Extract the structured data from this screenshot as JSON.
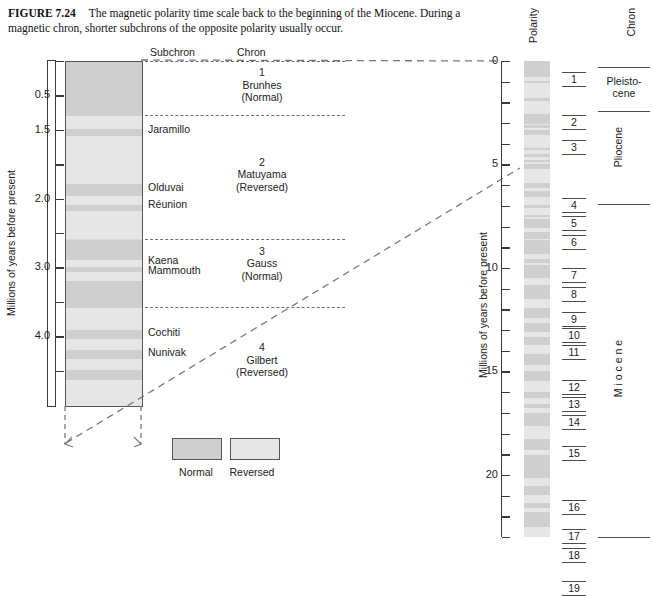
{
  "caption": {
    "figure_number": "FIGURE 7.24",
    "text": "The magnetic polarity time scale back to the beginning of the Miocene. During a magnetic chron, shorter subchrons of the opposite polarity usually occur."
  },
  "colors": {
    "normal": "#cfcfcf",
    "reversed": "#e6e6e6",
    "axis": "#3a3a3a",
    "dashed": "#6f6f6f",
    "text": "#222222"
  },
  "left_panel": {
    "axis_label": "Millions of years before present",
    "headers": {
      "subchron": "Subchron",
      "chron": "Chron"
    },
    "axis": {
      "min": 0,
      "max": 5.0,
      "tick_labels": [
        "0.5",
        "1.5",
        "2.0",
        "3.0",
        "4.0"
      ]
    },
    "ticks": [
      {
        "label": "",
        "value": 0.0
      },
      {
        "label": "0.5",
        "value": 0.5
      },
      {
        "label": "1.5",
        "value": 1.0
      },
      {
        "label": "",
        "value": 1.5
      },
      {
        "label": "2.0",
        "value": 2.0
      },
      {
        "label": "",
        "value": 2.5
      },
      {
        "label": "3.0",
        "value": 3.0
      },
      {
        "label": "",
        "value": 3.5
      },
      {
        "label": "4.0",
        "value": 4.0
      },
      {
        "label": "",
        "value": 4.5
      }
    ],
    "subchrons": [
      {
        "name": "Jaramillo",
        "value": 1.0
      },
      {
        "name": "Olduvai",
        "value": 1.85
      },
      {
        "name": "Réunion",
        "value": 2.1
      },
      {
        "name": "Kaena",
        "value": 2.9
      },
      {
        "name": "Mammouth",
        "value": 3.05
      },
      {
        "name": "Cochiti",
        "value": 3.95
      },
      {
        "name": "Nunivak",
        "value": 4.25
      }
    ],
    "chrons": [
      {
        "number": "1",
        "name": "Brunhes",
        "polarity": "(Normal)",
        "value": 0.35
      },
      {
        "number": "2",
        "name": "Matuyama",
        "polarity": "(Reversed)",
        "value": 1.65
      },
      {
        "number": "3",
        "name": "Gauss",
        "polarity": "(Normal)",
        "value": 2.95
      },
      {
        "number": "4",
        "name": "Gilbert",
        "polarity": "(Reversed)",
        "value": 4.35
      }
    ],
    "chron_boundaries": [
      0.0,
      0.78,
      2.58,
      3.58
    ],
    "bands": [
      {
        "polarity": "normal",
        "top": 0.0,
        "bottom": 0.78
      },
      {
        "polarity": "reversed",
        "top": 0.78,
        "bottom": 0.97
      },
      {
        "polarity": "normal",
        "top": 0.97,
        "bottom": 1.07
      },
      {
        "polarity": "reversed",
        "top": 1.07,
        "bottom": 1.78
      },
      {
        "polarity": "normal",
        "top": 1.78,
        "bottom": 1.95
      },
      {
        "polarity": "reversed",
        "top": 1.95,
        "bottom": 2.08
      },
      {
        "polarity": "normal",
        "top": 2.08,
        "bottom": 2.16
      },
      {
        "polarity": "reversed",
        "top": 2.16,
        "bottom": 2.58
      },
      {
        "polarity": "normal",
        "top": 2.58,
        "bottom": 2.88
      },
      {
        "polarity": "reversed",
        "top": 2.88,
        "bottom": 2.98
      },
      {
        "polarity": "normal",
        "top": 2.98,
        "bottom": 3.05
      },
      {
        "polarity": "reversed",
        "top": 3.05,
        "bottom": 3.18
      },
      {
        "polarity": "normal",
        "top": 3.18,
        "bottom": 3.58
      },
      {
        "polarity": "reversed",
        "top": 3.58,
        "bottom": 3.9
      },
      {
        "polarity": "normal",
        "top": 3.9,
        "bottom": 4.03
      },
      {
        "polarity": "reversed",
        "top": 4.03,
        "bottom": 4.18
      },
      {
        "polarity": "normal",
        "top": 4.18,
        "bottom": 4.32
      },
      {
        "polarity": "reversed",
        "top": 4.32,
        "bottom": 4.48
      },
      {
        "polarity": "normal",
        "top": 4.48,
        "bottom": 4.62
      },
      {
        "polarity": "reversed",
        "top": 4.62,
        "bottom": 5.0
      }
    ]
  },
  "legend": {
    "items": [
      {
        "label": "Normal",
        "polarity": "normal"
      },
      {
        "label": "Reversed",
        "polarity": "reversed"
      }
    ]
  },
  "right_panel": {
    "axis_label": "Millions of years before present",
    "polarity_header": "Polarity",
    "chron_header": "Chron",
    "axis": {
      "min": 0,
      "max": 23,
      "major_tick_labels": [
        "0",
        "5",
        "10",
        "15",
        "20"
      ],
      "major_step": 5,
      "minor_step": 1
    },
    "chron_numbers": [
      {
        "number": "1",
        "value": 0.9
      },
      {
        "number": "2",
        "value": 3.0
      },
      {
        "number": "3",
        "value": 4.2
      },
      {
        "number": "4",
        "value": 7.0
      },
      {
        "number": "5",
        "value": 7.9
      },
      {
        "number": "6",
        "value": 8.8
      },
      {
        "number": "7",
        "value": 10.4
      },
      {
        "number": "8",
        "value": 11.3
      },
      {
        "number": "9",
        "value": 12.5
      },
      {
        "number": "10",
        "value": 13.3
      },
      {
        "number": "11",
        "value": 14.1
      },
      {
        "number": "12",
        "value": 15.8
      },
      {
        "number": "13",
        "value": 16.6
      },
      {
        "number": "14",
        "value": 17.5
      },
      {
        "number": "15",
        "value": 19.0
      },
      {
        "number": "16",
        "value": 21.6
      },
      {
        "number": "17",
        "value": 23.0
      },
      {
        "number": "18",
        "value": 23.9
      },
      {
        "number": "19",
        "value": 25.5
      }
    ],
    "epochs": [
      {
        "name": "Pleisto-\ncene",
        "top": 0.3,
        "bottom": 2.4,
        "orientation": "horizontal"
      },
      {
        "name": "Pliocene",
        "top": 2.4,
        "bottom": 6.9,
        "orientation": "vertical"
      },
      {
        "name": "M i o c e n e",
        "top": 6.9,
        "bottom": 26.2,
        "orientation": "vertical"
      }
    ],
    "bands": [
      {
        "polarity": "normal",
        "top": 0.0,
        "bottom": 0.78
      },
      {
        "polarity": "reversed",
        "top": 0.78,
        "bottom": 0.99
      },
      {
        "polarity": "normal",
        "top": 0.99,
        "bottom": 1.07
      },
      {
        "polarity": "reversed",
        "top": 1.07,
        "bottom": 1.77
      },
      {
        "polarity": "normal",
        "top": 1.77,
        "bottom": 1.95
      },
      {
        "polarity": "reversed",
        "top": 1.95,
        "bottom": 2.14
      },
      {
        "polarity": "normal",
        "top": 2.14,
        "bottom": 2.15
      },
      {
        "polarity": "reversed",
        "top": 2.15,
        "bottom": 2.58
      },
      {
        "polarity": "normal",
        "top": 2.58,
        "bottom": 3.04
      },
      {
        "polarity": "reversed",
        "top": 3.04,
        "bottom": 3.11
      },
      {
        "polarity": "normal",
        "top": 3.11,
        "bottom": 3.22
      },
      {
        "polarity": "reversed",
        "top": 3.22,
        "bottom": 3.33
      },
      {
        "polarity": "normal",
        "top": 3.33,
        "bottom": 3.58
      },
      {
        "polarity": "reversed",
        "top": 3.58,
        "bottom": 4.18
      },
      {
        "polarity": "normal",
        "top": 4.18,
        "bottom": 4.29
      },
      {
        "polarity": "reversed",
        "top": 4.29,
        "bottom": 4.48
      },
      {
        "polarity": "normal",
        "top": 4.48,
        "bottom": 4.62
      },
      {
        "polarity": "reversed",
        "top": 4.62,
        "bottom": 4.8
      },
      {
        "polarity": "normal",
        "top": 4.8,
        "bottom": 4.89
      },
      {
        "polarity": "reversed",
        "top": 4.89,
        "bottom": 4.98
      },
      {
        "polarity": "normal",
        "top": 4.98,
        "bottom": 5.23
      },
      {
        "polarity": "reversed",
        "top": 5.23,
        "bottom": 5.89
      },
      {
        "polarity": "normal",
        "top": 5.89,
        "bottom": 6.14
      },
      {
        "polarity": "reversed",
        "top": 6.14,
        "bottom": 6.27
      },
      {
        "polarity": "normal",
        "top": 6.27,
        "bottom": 6.56
      },
      {
        "polarity": "reversed",
        "top": 6.56,
        "bottom": 6.94
      },
      {
        "polarity": "normal",
        "top": 6.94,
        "bottom": 7.09
      },
      {
        "polarity": "reversed",
        "top": 7.09,
        "bottom": 7.43
      },
      {
        "polarity": "normal",
        "top": 7.43,
        "bottom": 7.55
      },
      {
        "polarity": "reversed",
        "top": 7.55,
        "bottom": 7.65
      },
      {
        "polarity": "normal",
        "top": 7.65,
        "bottom": 8.07
      },
      {
        "polarity": "reversed",
        "top": 8.07,
        "bottom": 8.25
      },
      {
        "polarity": "normal",
        "top": 8.25,
        "bottom": 8.58
      },
      {
        "polarity": "reversed",
        "top": 8.58,
        "bottom": 8.66
      },
      {
        "polarity": "normal",
        "top": 8.66,
        "bottom": 9.31
      },
      {
        "polarity": "reversed",
        "top": 9.31,
        "bottom": 9.58
      },
      {
        "polarity": "normal",
        "top": 9.58,
        "bottom": 9.74
      },
      {
        "polarity": "reversed",
        "top": 9.74,
        "bottom": 9.88
      },
      {
        "polarity": "normal",
        "top": 9.88,
        "bottom": 10.47
      },
      {
        "polarity": "reversed",
        "top": 10.47,
        "bottom": 10.84
      },
      {
        "polarity": "normal",
        "top": 10.84,
        "bottom": 11.48
      },
      {
        "polarity": "reversed",
        "top": 11.48,
        "bottom": 11.94
      },
      {
        "polarity": "normal",
        "top": 11.94,
        "bottom": 12.4
      },
      {
        "polarity": "reversed",
        "top": 12.4,
        "bottom": 12.68
      },
      {
        "polarity": "normal",
        "top": 12.68,
        "bottom": 13.09
      },
      {
        "polarity": "reversed",
        "top": 13.09,
        "bottom": 13.35
      },
      {
        "polarity": "normal",
        "top": 13.35,
        "bottom": 13.73
      },
      {
        "polarity": "reversed",
        "top": 13.73,
        "bottom": 14.14
      },
      {
        "polarity": "normal",
        "top": 14.14,
        "bottom": 14.7
      },
      {
        "polarity": "reversed",
        "top": 14.7,
        "bottom": 14.96
      },
      {
        "polarity": "normal",
        "top": 14.96,
        "bottom": 15.47
      },
      {
        "polarity": "reversed",
        "top": 15.47,
        "bottom": 16.01
      },
      {
        "polarity": "normal",
        "top": 16.01,
        "bottom": 16.29
      },
      {
        "polarity": "reversed",
        "top": 16.29,
        "bottom": 16.55
      },
      {
        "polarity": "normal",
        "top": 16.55,
        "bottom": 16.75
      },
      {
        "polarity": "reversed",
        "top": 16.75,
        "bottom": 17.0
      },
      {
        "polarity": "normal",
        "top": 17.0,
        "bottom": 17.65
      },
      {
        "polarity": "reversed",
        "top": 17.65,
        "bottom": 18.28
      },
      {
        "polarity": "normal",
        "top": 18.28,
        "bottom": 18.78
      },
      {
        "polarity": "reversed",
        "top": 18.78,
        "bottom": 19.05
      },
      {
        "polarity": "normal",
        "top": 19.05,
        "bottom": 20.13
      },
      {
        "polarity": "reversed",
        "top": 20.13,
        "bottom": 20.52
      },
      {
        "polarity": "normal",
        "top": 20.52,
        "bottom": 20.97
      },
      {
        "polarity": "reversed",
        "top": 20.97,
        "bottom": 21.37
      },
      {
        "polarity": "normal",
        "top": 21.37,
        "bottom": 21.6
      },
      {
        "polarity": "reversed",
        "top": 21.6,
        "bottom": 21.77
      },
      {
        "polarity": "normal",
        "top": 21.77,
        "bottom": 22.5
      },
      {
        "polarity": "reversed",
        "top": 22.5,
        "bottom": 23.0
      }
    ]
  }
}
